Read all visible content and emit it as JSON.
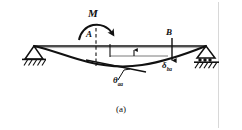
{
  "figure": {
    "caption": "(a)",
    "type": "beam-deflection-diagram",
    "background_color": "#ffffff",
    "line_color": "#111111"
  },
  "labels": {
    "moment": "M",
    "point_a": "A",
    "point_b": "B",
    "deflection_symbol": "δ",
    "deflection_subscript": "ba",
    "rotation_symbol": "θ",
    "rotation_subscript": "aa"
  },
  "diagram": {
    "supports": [
      {
        "name": "left-pin-support",
        "type": "pin",
        "x": 34,
        "y": 46
      },
      {
        "name": "right-roller-support",
        "type": "roller",
        "x": 206,
        "y": 46
      }
    ],
    "beam_axis": {
      "x1": 34,
      "y1": 46,
      "x2": 206,
      "y2": 46
    },
    "point_a_station": 96,
    "point_b_station": 172,
    "applied_moment": {
      "at": "A",
      "sense": "clockwise",
      "symbol": "M"
    },
    "deflected_shape_note": "beam sags below axis with maximum dip left of midspan",
    "tangent_at_a_note": "tangent line drawn at A sloping down to the right",
    "delta_arrow_note": "vertical arrow at B from beam axis down to deflected curve",
    "theta_leader_note": "leader line from tangent at A down to theta label"
  }
}
